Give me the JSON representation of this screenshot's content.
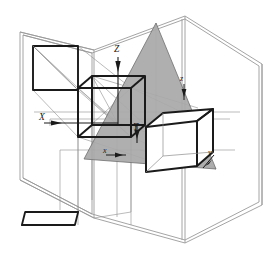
{
  "figure": {
    "background_color": "#ffffff",
    "width": 269,
    "height": 255
  },
  "colors": {
    "outline_dark": "#1a1a1a",
    "thin_gray": "#8d8d8d",
    "frame_gray": "#9a9a9a",
    "triangle_fill": "#a8a8a8",
    "triangle_stroke": "#6f6f6f",
    "cube_fill": "#ffffff",
    "label_color": "#1a1a1a"
  },
  "axes": {
    "world": [
      {
        "label": "Z",
        "name": "world-axis-z",
        "direction": "up",
        "x": 118,
        "y": 48
      },
      {
        "label": "X",
        "name": "world-axis-x",
        "direction": "right",
        "x": 44,
        "y": 119
      },
      {
        "label": "Y",
        "name": "world-axis-y",
        "direction": "down",
        "x": 137,
        "y": 129
      }
    ],
    "local": [
      {
        "label": "z",
        "name": "local-axis-z",
        "direction": "down",
        "x": 184,
        "y": 80
      },
      {
        "label": "x",
        "name": "local-axis-x",
        "direction": "right",
        "x": 108,
        "y": 153
      },
      {
        "label": "y",
        "name": "local-axis-y",
        "direction": "down-left",
        "x": 209,
        "y": 157
      }
    ]
  },
  "objects": {
    "outer_frame": {
      "name": "room-frame",
      "description": "open box / room frame in light gray double lines"
    },
    "back_wall_projection": {
      "name": "back-wall-projection-square",
      "description": "square projection of cube on back wall with diagonal"
    },
    "floor_projection": {
      "name": "floor-projection-parallelogram",
      "description": "parallelogram projection of cube on floor plane"
    },
    "center_cube": {
      "name": "center-cube",
      "description": "wireframe cube at world origin"
    },
    "right_cube": {
      "name": "right-cube",
      "description": "solid white cube on the gray image plane"
    },
    "image_plane": {
      "name": "image-plane-triangle",
      "description": "gray triangular image / projection plane"
    },
    "projection_rays": {
      "name": "projection-rays",
      "description": "thin gray construction lines from cube to planes"
    }
  }
}
